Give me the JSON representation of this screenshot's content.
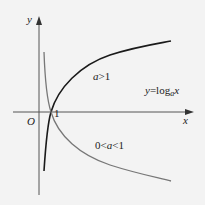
{
  "axes": {
    "x_label": "x",
    "y_label": "y",
    "origin_label": "O",
    "one_label": "1"
  },
  "curves": {
    "a_greater_1": {
      "label_a": "a",
      "label_rest": ">1",
      "color": "#1a1a1a"
    },
    "a_between": {
      "label_pre": "0<",
      "label_a": "a",
      "label_post": "<1",
      "color": "#777777"
    }
  },
  "formula": {
    "y": "y",
    "eq": "=log",
    "sub": "a",
    "x": "x"
  }
}
